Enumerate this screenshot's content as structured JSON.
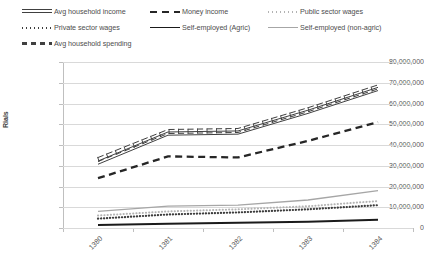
{
  "legend": {
    "items": [
      {
        "label": "Avg household income",
        "key": "double-line",
        "row": 0,
        "col": 0
      },
      {
        "label": "Money income",
        "key": "long-dash",
        "row": 0,
        "col": 1
      },
      {
        "label": "Public sector wages",
        "key": "light-dotted",
        "row": 0,
        "col": 2
      },
      {
        "label": "Private sector wages",
        "key": "dark-dotted",
        "row": 1,
        "col": 0
      },
      {
        "label": "Self-employed (Agric)",
        "key": "solid-black",
        "row": 1,
        "col": 1
      },
      {
        "label": "Self-employed (non-agric)",
        "key": "gray-line",
        "row": 1,
        "col": 2
      },
      {
        "label": "Avg household spending",
        "key": "dashed-box",
        "row": 2,
        "col": 0
      }
    ]
  },
  "axes": {
    "y_title": "Rials",
    "y_ticks": [
      "80,000,000",
      "70,000,000",
      "60,000,000",
      "50,000,000",
      "40,000,000",
      "30,000,000",
      "20,000,000",
      "10,000,000",
      "0"
    ],
    "x_ticks": [
      "1380",
      "1381",
      "1382",
      "1383",
      "1384"
    ]
  },
  "chart_data": {
    "type": "line",
    "title": "",
    "xlabel": "",
    "ylabel": "Rials",
    "ylim": [
      0,
      80000000
    ],
    "ytick_interval": 10000000,
    "grid": true,
    "legend_position": "top",
    "categories": [
      "1380",
      "1381",
      "1382",
      "1383",
      "1384"
    ],
    "series": [
      {
        "name": "Avg household spending",
        "style": "dashed-box",
        "color": "#404040",
        "values": [
          33000000,
          46500000,
          47000000,
          57000000,
          68000000
        ]
      },
      {
        "name": "Avg household income",
        "style": "double-line",
        "color": "#404040",
        "values": [
          31500000,
          45500000,
          46000000,
          56000000,
          67000000
        ]
      },
      {
        "name": "Money income",
        "style": "long-dash",
        "color": "#262626",
        "values": [
          24000000,
          34500000,
          34000000,
          42000000,
          51000000
        ]
      },
      {
        "name": "Self-employed (non-agric)",
        "style": "gray-line",
        "color": "#a6a6a6",
        "values": [
          8000000,
          10500000,
          11000000,
          13500000,
          18000000
        ]
      },
      {
        "name": "Public sector wages",
        "style": "light-dotted",
        "color": "#b3b3b3",
        "values": [
          6000000,
          8000000,
          9000000,
          10500000,
          13000000
        ]
      },
      {
        "name": "Private sector wages",
        "style": "dark-dotted",
        "color": "#3d3d3d",
        "values": [
          4500000,
          6500000,
          7500000,
          9000000,
          11000000
        ]
      },
      {
        "name": "Self-employed (Agric)",
        "style": "solid-black",
        "color": "#1a1a1a",
        "values": [
          1500000,
          2000000,
          2500000,
          3000000,
          4000000
        ]
      }
    ]
  }
}
